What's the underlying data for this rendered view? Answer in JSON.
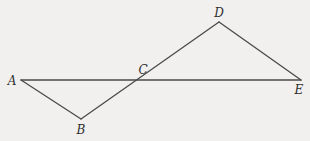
{
  "diagram": {
    "type": "geometry",
    "points": [
      {
        "id": "A",
        "label": "A",
        "x": 21,
        "y": 80,
        "label_x": 12,
        "label_y": 81
      },
      {
        "id": "B",
        "label": "B",
        "x": 81,
        "y": 119,
        "label_x": 81,
        "label_y": 130
      },
      {
        "id": "C",
        "label": "C",
        "x": 139,
        "y": 80,
        "label_x": 143,
        "label_y": 70
      },
      {
        "id": "D",
        "label": "D",
        "x": 219,
        "y": 22,
        "label_x": 219,
        "label_y": 13
      },
      {
        "id": "E",
        "label": "E",
        "x": 301,
        "y": 80,
        "label_x": 299,
        "label_y": 90
      }
    ],
    "segments": [
      {
        "from": "A",
        "to": "E"
      },
      {
        "from": "A",
        "to": "B"
      },
      {
        "from": "B",
        "to": "D"
      },
      {
        "from": "D",
        "to": "E"
      }
    ],
    "colors": {
      "background": "#f1f0ee",
      "line": "#4a4a4a",
      "label": "#2e2e2e"
    }
  }
}
